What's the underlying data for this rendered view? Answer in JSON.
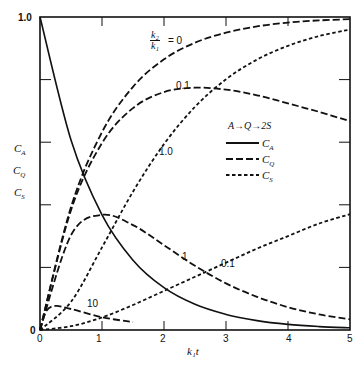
{
  "chart_data": {
    "type": "line",
    "title": "",
    "xlabel": "k1 t",
    "ylabel": [
      "C_A",
      "C_Q",
      "C_S"
    ],
    "xlim": [
      0,
      5
    ],
    "ylim": [
      0,
      1.0
    ],
    "x_ticks": [
      0,
      1,
      2,
      3,
      4,
      5
    ],
    "y_tick_labels": [
      "0",
      "1.0"
    ],
    "y_ticks": [
      0,
      0.2,
      0.4,
      0.6,
      0.8,
      1.0
    ],
    "grid": false,
    "legend": {
      "title": "A →(k1) Q →(k2) 2S",
      "entries": [
        {
          "label": "C_A",
          "style": "solid"
        },
        {
          "label": "C_Q",
          "style": "long-dash"
        },
        {
          "label": "C_S",
          "style": "short-dash"
        }
      ],
      "position": "center-right"
    },
    "parameter": "k2/k1",
    "series": [
      {
        "name": "C_A",
        "style": "solid",
        "x": [
          0,
          0.5,
          1,
          1.5,
          2,
          2.5,
          3,
          3.5,
          4,
          4.5,
          5
        ],
        "values": [
          1,
          0.607,
          0.368,
          0.223,
          0.135,
          0.082,
          0.05,
          0.03,
          0.018,
          0.011,
          0.007
        ]
      },
      {
        "name": "C_Q k2/k1=0",
        "label": "k2/k1 = 0",
        "style": "long-dash",
        "x": [
          0,
          0.5,
          1,
          1.5,
          2,
          2.5,
          3,
          3.5,
          4,
          4.5,
          5
        ],
        "values": [
          0,
          0.393,
          0.632,
          0.777,
          0.865,
          0.918,
          0.95,
          0.97,
          0.982,
          0.989,
          0.993
        ]
      },
      {
        "name": "C_Q k2/k1=0.1",
        "label": "0.1",
        "style": "long-dash",
        "x": [
          0,
          0.5,
          1,
          1.5,
          2,
          2.5,
          3,
          3.5,
          4,
          4.5,
          5
        ],
        "values": [
          0,
          0.383,
          0.597,
          0.709,
          0.76,
          0.774,
          0.768,
          0.75,
          0.724,
          0.697,
          0.667
        ]
      },
      {
        "name": "C_Q k2/k1=1",
        "label": "1",
        "style": "long-dash",
        "x": [
          0,
          0.5,
          1,
          1.5,
          2,
          2.5,
          3,
          3.5,
          4,
          4.5,
          5
        ],
        "values": [
          0,
          0.303,
          0.368,
          0.335,
          0.271,
          0.205,
          0.149,
          0.106,
          0.073,
          0.05,
          0.034
        ]
      },
      {
        "name": "C_Q k2/k1=10",
        "label": "10",
        "style": "long-dash",
        "x": [
          0,
          0.1,
          0.25,
          0.5,
          1,
          1.5
        ],
        "values": [
          0,
          0.06,
          0.077,
          0.067,
          0.041,
          0.025
        ]
      },
      {
        "name": "C_S k2/k1=1",
        "label": "1.0",
        "style": "short-dash",
        "x": [
          0,
          0.5,
          1,
          1.5,
          2,
          2.5,
          3,
          3.5,
          4,
          4.5,
          5
        ],
        "values": [
          0,
          0.09,
          0.264,
          0.442,
          0.594,
          0.713,
          0.801,
          0.864,
          0.908,
          0.939,
          0.96
        ]
      },
      {
        "name": "C_S k2/k1=0.1",
        "label": "0.1",
        "style": "short-dash",
        "x": [
          0,
          0.5,
          1,
          1.5,
          2,
          2.5,
          3,
          3.5,
          4,
          4.5,
          5
        ],
        "values": [
          0,
          0.012,
          0.04,
          0.08,
          0.125,
          0.17,
          0.215,
          0.26,
          0.3,
          0.34,
          0.37
        ]
      }
    ]
  },
  "labels": {
    "y_top": "1.0",
    "y_zero": "0",
    "x_ticks": [
      "0",
      "1",
      "2",
      "3",
      "4",
      "5"
    ],
    "x_axis": "k₁t",
    "y_axis": [
      "Cₐ",
      "C_Q",
      "C_S"
    ],
    "ylabel_CA": "C",
    "ylabel_CA_sub": "A",
    "ylabel_CQ": "C",
    "ylabel_CQ_sub": "Q",
    "ylabel_CS": "C",
    "ylabel_CS_sub": "S",
    "ratio_num": "k₂",
    "ratio_den": "k₁",
    "ratio_eq": "= 0",
    "curve_01_q": "0.1",
    "curve_10_s": "1.0",
    "curve_1_q": "1",
    "curve_01_s": "0.1",
    "curve_10_q": "10",
    "legend_reaction": "A→Q→2S",
    "legend_CA": "C",
    "legend_CA_sub": "A",
    "legend_CQ": "C",
    "legend_CQ_sub": "Q",
    "legend_CS": "C",
    "legend_CS_sub": "S"
  }
}
